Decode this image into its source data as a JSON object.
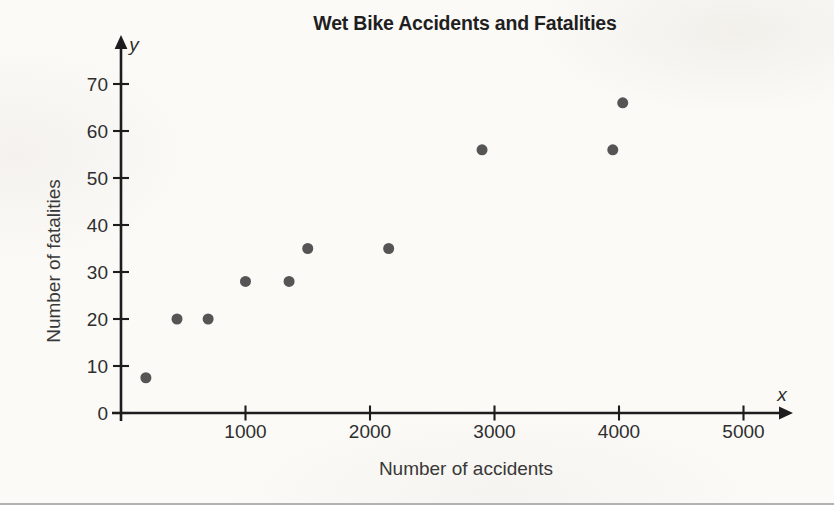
{
  "chart_data": {
    "type": "scatter",
    "title": "Wet Bike Accidents and Fatalities",
    "xlabel": "Number of accidents",
    "ylabel": "Number of fatalities",
    "x_axis_letter": "x",
    "y_axis_letter": "y",
    "xlim": [
      0,
      5350
    ],
    "ylim": [
      0,
      78
    ],
    "x_ticks": [
      1000,
      2000,
      3000,
      4000,
      5000
    ],
    "y_ticks": [
      0,
      10,
      20,
      30,
      40,
      50,
      60,
      70
    ],
    "grid": false,
    "legend": null,
    "points": [
      {
        "x": 200,
        "y": 7.5
      },
      {
        "x": 450,
        "y": 20
      },
      {
        "x": 700,
        "y": 20
      },
      {
        "x": 1000,
        "y": 28
      },
      {
        "x": 1350,
        "y": 28
      },
      {
        "x": 1500,
        "y": 35
      },
      {
        "x": 2150,
        "y": 35
      },
      {
        "x": 2900,
        "y": 56
      },
      {
        "x": 3950,
        "y": 56
      },
      {
        "x": 4030,
        "y": 66
      }
    ],
    "point_color": "#4e4e4e",
    "axis_color": "#1d1d1d"
  }
}
